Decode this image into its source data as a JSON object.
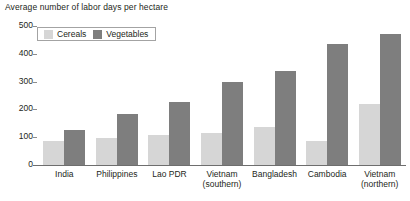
{
  "chart_data": {
    "type": "bar",
    "title": "Average number of labor days per hectare",
    "xlabel": "",
    "ylabel": "",
    "ylim": [
      0,
      500
    ],
    "yticks": [
      0,
      100,
      200,
      300,
      400,
      500
    ],
    "ytick_labels": [
      "0",
      "100",
      "200",
      "300",
      "400",
      "500"
    ],
    "grid": false,
    "legend_position": "top-left",
    "categories": [
      "India",
      "Philippines",
      "Lao PDR",
      "Vietnam (southern)",
      "Bangladesh",
      "Cambodia",
      "Vietnam (northern)"
    ],
    "category_lines": [
      [
        "India"
      ],
      [
        "Philippines"
      ],
      [
        "Lao PDR"
      ],
      [
        "Vietnam",
        "(southern)"
      ],
      [
        "Bangladesh"
      ],
      [
        "Cambodia"
      ],
      [
        "Vietnam",
        "(northern)"
      ]
    ],
    "series": [
      {
        "name": "Cereals",
        "color": "#d6d6d6",
        "values": [
          88,
          97,
          108,
          115,
          137,
          88,
          220
        ]
      },
      {
        "name": "Vegetables",
        "color": "#7e7e7e",
        "values": [
          125,
          185,
          228,
          298,
          338,
          437,
          470
        ]
      }
    ]
  }
}
